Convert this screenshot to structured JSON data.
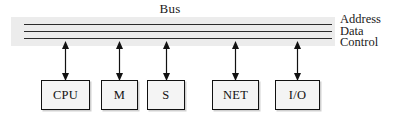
{
  "diagram": {
    "title": "Bus",
    "bus": {
      "lines": [
        {
          "id": "address",
          "label": "Address"
        },
        {
          "id": "data",
          "label": "Data"
        },
        {
          "id": "control",
          "label": "Control"
        }
      ],
      "band_color": "#ececec",
      "line_color": "#2b2b2b"
    },
    "nodes": [
      {
        "id": "cpu",
        "label": "CPU"
      },
      {
        "id": "m",
        "label": "M"
      },
      {
        "id": "s",
        "label": "S"
      },
      {
        "id": "net",
        "label": "NET"
      },
      {
        "id": "io",
        "label": "I/O"
      }
    ],
    "connectors": {
      "type": "double-headed-arrow",
      "count": 5,
      "color": "#111111"
    },
    "colors": {
      "background": "#ffffff",
      "box_fill": "#f4f4f4",
      "box_border": "#111111",
      "text": "#111111"
    }
  }
}
